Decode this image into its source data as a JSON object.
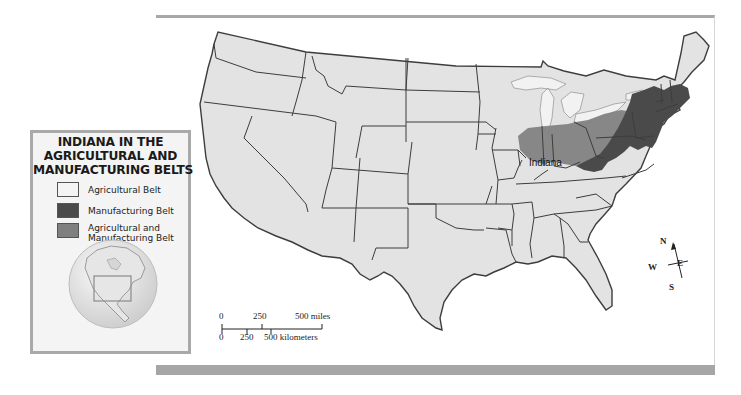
{
  "legend": {
    "title_lines": [
      "INDIANA IN THE",
      "AGRICULTURAL AND",
      "MANUFACTURING BELTS"
    ],
    "items": [
      {
        "label_lines": [
          "Agricultural Belt"
        ],
        "color": "#f4f4f4"
      },
      {
        "label_lines": [
          "Manufacturing Belt"
        ],
        "color": "#4a4a4a"
      },
      {
        "label_lines": [
          "Agricultural and",
          "Manufacturing Belt"
        ],
        "color": "#808080"
      }
    ],
    "inset": "globe-locator-north-america"
  },
  "map": {
    "place_label": "Indiana",
    "colors": {
      "land": "#e3e3e3",
      "lakes": "#e9e9e9",
      "border": "#3a3a3a",
      "manufacturing_belt": "#4a4a4a",
      "agricultural_manufacturing_belt": "#828282",
      "agricultural_belt_tint": "#efefef"
    }
  },
  "scale_bar": {
    "miles_ticks": [
      "0",
      "250",
      "500 miles"
    ],
    "km_ticks": [
      "0",
      "250",
      "500 kilometers"
    ]
  },
  "compass": {
    "n": "N",
    "s": "S",
    "e": "E",
    "w": "W"
  }
}
